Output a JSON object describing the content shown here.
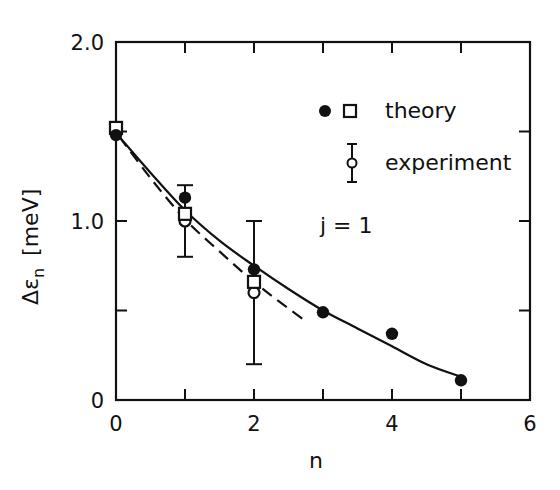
{
  "chart_data": {
    "type": "scatter",
    "title": "",
    "xlabel": "n",
    "ylabel": "Δε_n  [meV]",
    "ylabel_parts": {
      "symbol": "Δε",
      "subscript": "n",
      "unit": "[meV]"
    },
    "xlim": [
      0,
      6
    ],
    "ylim": [
      0,
      2.0
    ],
    "x_ticks": [
      0,
      2,
      4,
      6
    ],
    "x_tick_labels": [
      "0",
      "2",
      "4",
      "6"
    ],
    "x_minor_ticks": [
      1,
      3,
      5
    ],
    "y_ticks": [
      0,
      1.0,
      2.0
    ],
    "y_tick_labels": [
      "0",
      "1.0",
      "2.0"
    ],
    "y_minor_ticks": [
      0.5,
      1.5
    ],
    "grid": false,
    "legend_position": "upper right (inside)",
    "annotation": "j = 1",
    "series": [
      {
        "name": "theory (filled circles)",
        "legend_group": "theory",
        "marker": "filled-circle",
        "x": [
          0,
          1,
          2,
          3,
          4,
          5
        ],
        "y": [
          1.48,
          1.13,
          0.73,
          0.49,
          0.37,
          0.11
        ]
      },
      {
        "name": "theory (open squares)",
        "legend_group": "theory",
        "marker": "open-square",
        "x": [
          0,
          1,
          2
        ],
        "y": [
          1.52,
          1.04,
          0.66
        ]
      },
      {
        "name": "experiment",
        "legend_group": "experiment",
        "marker": "open-circle-errorbar",
        "x": [
          0,
          1,
          2
        ],
        "y": [
          1.5,
          1.0,
          0.6
        ],
        "y_err_low": [
          null,
          0.8,
          0.2
        ],
        "y_err_high": [
          null,
          1.2,
          1.0
        ]
      },
      {
        "name": "solid curve (fit to filled circles)",
        "line": "solid",
        "x": [
          0.05,
          0.5,
          1.0,
          1.5,
          2.0,
          2.5,
          3.0,
          3.5,
          4.0,
          4.5,
          5.0
        ],
        "y": [
          1.47,
          1.27,
          1.06,
          0.89,
          0.75,
          0.62,
          0.5,
          0.4,
          0.3,
          0.2,
          0.13
        ]
      },
      {
        "name": "dashed curve",
        "line": "dashed",
        "x": [
          0.05,
          0.5,
          1.0,
          1.5,
          2.0,
          2.4,
          2.75
        ],
        "y": [
          1.47,
          1.24,
          1.01,
          0.83,
          0.66,
          0.54,
          0.44
        ]
      }
    ],
    "legend": [
      {
        "label": "theory",
        "symbols": [
          "filled-circle",
          "open-square"
        ]
      },
      {
        "label": "experiment",
        "symbols": [
          "open-circle-errorbar"
        ]
      }
    ]
  },
  "legend": {
    "theory_label": "theory",
    "experiment_label": "experiment",
    "annotation": "j = 1"
  },
  "axes": {
    "xlabel": "n",
    "ylabel_symbol": "Δε",
    "ylabel_sub": "n",
    "ylabel_unit": "[meV]"
  },
  "colors": {
    "ink": "#111111",
    "background": "#ffffff"
  }
}
